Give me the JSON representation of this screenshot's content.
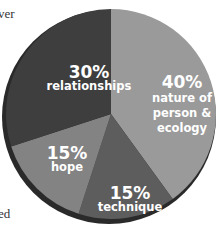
{
  "text_fragments": {
    "top_left": "ver",
    "bottom_left": "ed"
  },
  "colors": {
    "relationships": "#3e3e3e",
    "nature": "#9a9a9a",
    "technique": "#5d5d5d",
    "hope": "#838383",
    "rim": "#2a2a2a",
    "label_text": "#ffffff"
  },
  "chart_data": {
    "type": "pie",
    "title": "",
    "legend": "none (labels inside slices)",
    "start_angle_deg": 0,
    "direction": "clockwise",
    "slices": [
      {
        "label": "nature of person & ecology",
        "percent": "40%",
        "value": 40
      },
      {
        "label": "technique",
        "percent": "15%",
        "value": 15
      },
      {
        "label": "hope",
        "percent": "15%",
        "value": 15
      },
      {
        "label": "relationships",
        "percent": "30%",
        "value": 30
      }
    ],
    "categories": [
      "nature of person & ecology",
      "technique",
      "hope",
      "relationships"
    ],
    "values": [
      40,
      15,
      15,
      30
    ]
  },
  "labels": {
    "relationships": {
      "pct": "30%",
      "name": "relationships"
    },
    "nature": {
      "pct": "40%",
      "line1": "nature of",
      "line2": "person &",
      "line3": "ecology"
    },
    "hope": {
      "pct": "15%",
      "name": "hope"
    },
    "technique": {
      "pct": "15%",
      "name": "technique"
    }
  }
}
